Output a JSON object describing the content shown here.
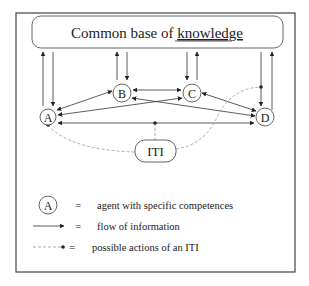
{
  "diagram": {
    "knowledge_base": {
      "label_prefix": "Common base of ",
      "label_underlined": "knowledge"
    },
    "agents": [
      {
        "id": "A",
        "label": "A"
      },
      {
        "id": "B",
        "label": "B"
      },
      {
        "id": "C",
        "label": "C"
      },
      {
        "id": "D",
        "label": "D"
      }
    ],
    "iti": {
      "label": "ITI"
    },
    "edges": [
      {
        "from": "A",
        "to": "knowledge_base",
        "type": "flow"
      },
      {
        "from": "knowledge_base",
        "to": "A",
        "type": "flow"
      },
      {
        "from": "B",
        "to": "knowledge_base",
        "type": "flow"
      },
      {
        "from": "knowledge_base",
        "to": "B",
        "type": "flow"
      },
      {
        "from": "knowledge_base",
        "to": "C",
        "type": "flow"
      },
      {
        "from": "C",
        "to": "knowledge_base",
        "type": "flow"
      },
      {
        "from": "knowledge_base",
        "to": "D",
        "type": "flow"
      },
      {
        "from": "D",
        "to": "knowledge_base",
        "type": "flow"
      },
      {
        "from": "A",
        "to": "B",
        "type": "flow-bidirectional"
      },
      {
        "from": "B",
        "to": "C",
        "type": "flow-bidirectional"
      },
      {
        "from": "C",
        "to": "D",
        "type": "flow-bidirectional"
      },
      {
        "from": "A",
        "to": "C",
        "type": "flow-bidirectional"
      },
      {
        "from": "B",
        "to": "D",
        "type": "flow-bidirectional"
      },
      {
        "from": "A",
        "to": "D",
        "type": "flow-bidirectional"
      },
      {
        "from": "ITI",
        "to": "A",
        "type": "iti-action"
      },
      {
        "from": "ITI",
        "to": "A-D link",
        "type": "iti-action"
      },
      {
        "from": "ITI",
        "to": "knowledge_base-D link",
        "type": "iti-action"
      }
    ]
  },
  "legend": {
    "items": [
      {
        "symbol": "A",
        "equals": "=",
        "text": "agent with specific competences"
      },
      {
        "symbol": "arrow",
        "equals": "=",
        "text": "flow of information"
      },
      {
        "symbol": "dashed-dot",
        "equals": "=",
        "text": "possible actions of an ITI"
      }
    ]
  }
}
